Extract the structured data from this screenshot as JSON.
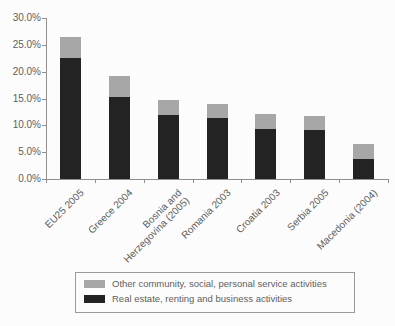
{
  "chart_data": {
    "type": "bar",
    "stacked": true,
    "title": "",
    "xlabel": "",
    "ylabel": "",
    "grid": false,
    "legend_position": "bottom-box",
    "categories": [
      "EU25 2005",
      "Greece 2004",
      "Bosnia and\nHerzegovina (2005)",
      "Romania 2003",
      "Croatia 2003",
      "Serbia 2005",
      "Macedonia (2004)"
    ],
    "series": [
      {
        "name": "Real estate, renting and business activities",
        "color": "#232323",
        "values": [
          22.5,
          15.2,
          12.0,
          11.4,
          9.4,
          9.1,
          3.7
        ]
      },
      {
        "name": "Other community, social, personal service activities",
        "color": "#a7a7a7",
        "values": [
          4.0,
          4.0,
          2.8,
          2.6,
          2.8,
          2.6,
          2.8
        ]
      }
    ],
    "ylim": [
      0,
      30
    ],
    "yticks": [
      "0.0%",
      "5.0%",
      "10.0%",
      "15.0%",
      "20.0%",
      "25.0%",
      "30.0%"
    ]
  },
  "colors": {
    "axis": "#8f8f8f",
    "text": "#5e5e5e",
    "background": "#fcfcfc",
    "legend_border": "#9a9a9a"
  }
}
